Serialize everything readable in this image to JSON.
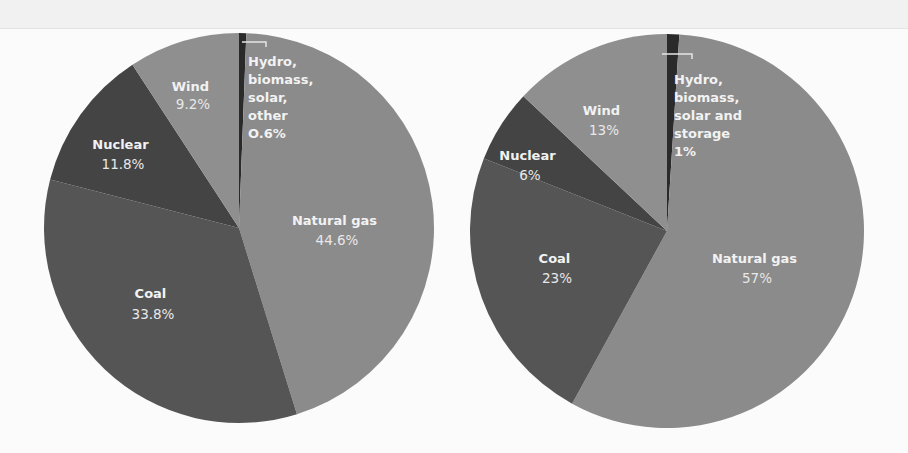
{
  "chart_data": [
    {
      "type": "pie",
      "title": "",
      "slices": [
        {
          "name": "Hydro, biomass, solar, other",
          "label_lines": [
            "Hydro,",
            "biomass,",
            "solar,",
            "other"
          ],
          "value": 0.6,
          "value_label": "O.6%",
          "color": "#2a2a2a"
        },
        {
          "name": "Natural gas",
          "label_lines": [
            "Natural gas"
          ],
          "value": 44.6,
          "value_label": "44.6%",
          "color": "#8b8b8b"
        },
        {
          "name": "Coal",
          "label_lines": [
            "Coal"
          ],
          "value": 33.8,
          "value_label": "33.8%",
          "color": "#555555"
        },
        {
          "name": "Nuclear",
          "label_lines": [
            "Nuclear"
          ],
          "value": 11.8,
          "value_label": "11.8%",
          "color": "#444444"
        },
        {
          "name": "Wind",
          "label_lines": [
            "Wind"
          ],
          "value": 9.2,
          "value_label": "9.2%",
          "color": "#8f8f8f"
        }
      ],
      "start_angle_deg": 0,
      "direction": "clockwise"
    },
    {
      "type": "pie",
      "title": "",
      "slices": [
        {
          "name": "Hydro, biomass, solar and storage",
          "label_lines": [
            "Hydro,",
            "biomass,",
            "solar and",
            "storage"
          ],
          "value": 1,
          "value_label": "1%",
          "color": "#2a2a2a"
        },
        {
          "name": "Natural gas",
          "label_lines": [
            "Natural gas"
          ],
          "value": 57,
          "value_label": "57%",
          "color": "#8b8b8b"
        },
        {
          "name": "Coal",
          "label_lines": [
            "Coal"
          ],
          "value": 23,
          "value_label": "23%",
          "color": "#555555"
        },
        {
          "name": "Nuclear",
          "label_lines": [
            "Nuclear"
          ],
          "value": 6,
          "value_label": "6%",
          "color": "#444444"
        },
        {
          "name": "Wind",
          "label_lines": [
            "Wind"
          ],
          "value": 13,
          "value_label": "13%",
          "color": "#8f8f8f"
        }
      ],
      "start_angle_deg": 0,
      "direction": "clockwise"
    }
  ],
  "pies": [
    {
      "labels": {
        "hydro": {
          "lines": [
            "Hydro,",
            "biomass,",
            "solar,",
            "other"
          ],
          "value": "O.6%"
        },
        "gas": {
          "name": "Natural gas",
          "value": "44.6%"
        },
        "coal": {
          "name": "Coal",
          "value": "33.8%"
        },
        "nuclear": {
          "name": "Nuclear",
          "value": "11.8%"
        },
        "wind": {
          "name": "Wind",
          "value": "9.2%"
        }
      }
    },
    {
      "labels": {
        "hydro": {
          "lines": [
            "Hydro,",
            "biomass,",
            "solar and",
            "storage"
          ],
          "value": "1%"
        },
        "gas": {
          "name": "Natural gas",
          "value": "57%"
        },
        "coal": {
          "name": "Coal",
          "value": "23%"
        },
        "nuclear": {
          "name": "Nuclear",
          "value": "6%"
        },
        "wind": {
          "name": "Wind",
          "value": "13%"
        }
      }
    }
  ]
}
